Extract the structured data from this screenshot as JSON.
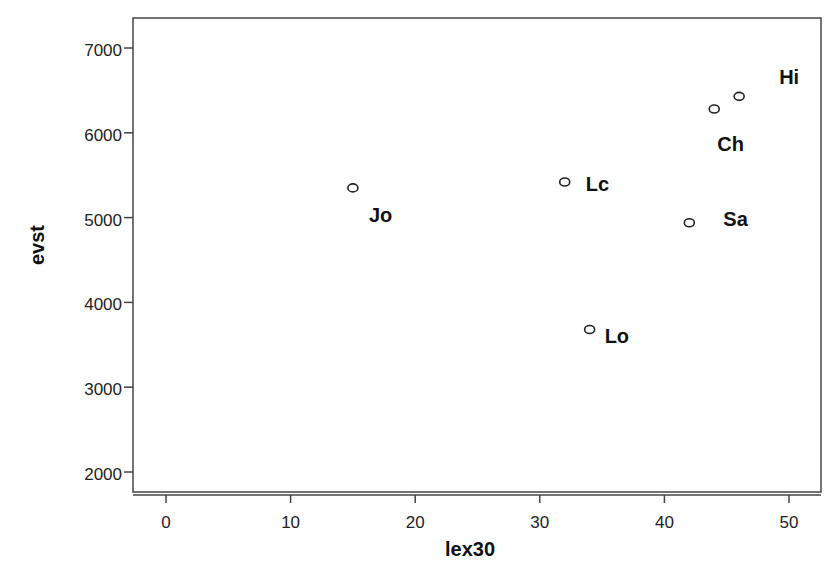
{
  "chart_data": {
    "type": "scatter",
    "title": "",
    "xlabel": "lex30",
    "ylabel": "evst",
    "xlim": [
      -2.8,
      52.5
    ],
    "ylim": [
      1750,
      7350
    ],
    "x_ticks": [
      0,
      10,
      20,
      30,
      40,
      50
    ],
    "y_ticks": [
      2000,
      3000,
      4000,
      5000,
      6000,
      7000
    ],
    "grid": false,
    "legend": null,
    "points": [
      {
        "label": "Jo",
        "x": 15,
        "y": 5350
      },
      {
        "label": "Lc",
        "x": 32,
        "y": 5420
      },
      {
        "label": "Lo",
        "x": 34,
        "y": 3680
      },
      {
        "label": "Sa",
        "x": 42,
        "y": 4940
      },
      {
        "label": "Ch",
        "x": 44,
        "y": 6280
      },
      {
        "label": "Hi",
        "x": 46,
        "y": 6430
      }
    ]
  }
}
